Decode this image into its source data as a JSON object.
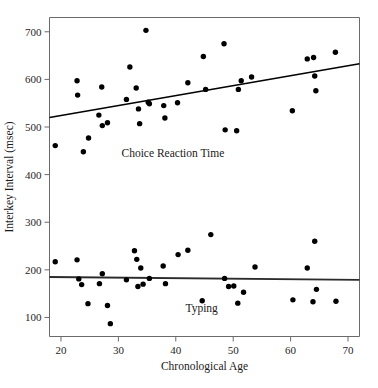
{
  "chart_data": {
    "type": "scatter",
    "title": "",
    "xlabel": "Chronological Age",
    "ylabel": "Interkey Interval (msec)",
    "xlim": [
      18,
      72
    ],
    "ylim": [
      60,
      730
    ],
    "xticks": [
      20,
      30,
      40,
      50,
      60,
      70
    ],
    "yticks": [
      100,
      200,
      300,
      400,
      500,
      600,
      700
    ],
    "grid": false,
    "legend_position": "in-plot annotations",
    "series": [
      {
        "name": "Choice Reaction Time",
        "label_x": 39.5,
        "label_y": 437,
        "points": [
          [
            19.0,
            461
          ],
          [
            22.8,
            597
          ],
          [
            22.9,
            567
          ],
          [
            23.9,
            448
          ],
          [
            24.8,
            477
          ],
          [
            26.6,
            525
          ],
          [
            27.1,
            584
          ],
          [
            27.2,
            503
          ],
          [
            28.1,
            509
          ],
          [
            31.4,
            558
          ],
          [
            32.0,
            626
          ],
          [
            33.1,
            582
          ],
          [
            33.5,
            538
          ],
          [
            33.7,
            507
          ],
          [
            34.8,
            703
          ],
          [
            35.2,
            552
          ],
          [
            35.4,
            549
          ],
          [
            37.9,
            545
          ],
          [
            38.1,
            519
          ],
          [
            40.3,
            551
          ],
          [
            42.1,
            593
          ],
          [
            44.8,
            648
          ],
          [
            45.2,
            579
          ],
          [
            48.4,
            675
          ],
          [
            48.6,
            494
          ],
          [
            50.6,
            492
          ],
          [
            50.9,
            579
          ],
          [
            51.4,
            597
          ],
          [
            53.2,
            605
          ],
          [
            60.3,
            534
          ],
          [
            62.9,
            643
          ],
          [
            64.0,
            646
          ],
          [
            64.2,
            607
          ],
          [
            64.4,
            576
          ],
          [
            67.8,
            657
          ]
        ],
        "fit_line": {
          "x0": 18,
          "y0": 520,
          "x1": 72,
          "y1": 633
        }
      },
      {
        "name": "Typing",
        "label_x": 44.5,
        "label_y": 112,
        "points": [
          [
            19.0,
            217
          ],
          [
            22.8,
            221
          ],
          [
            23.1,
            181
          ],
          [
            23.6,
            169
          ],
          [
            24.7,
            129
          ],
          [
            26.7,
            171
          ],
          [
            27.2,
            192
          ],
          [
            28.1,
            125
          ],
          [
            28.6,
            87
          ],
          [
            31.4,
            179
          ],
          [
            32.8,
            240
          ],
          [
            33.2,
            222
          ],
          [
            33.4,
            165
          ],
          [
            33.9,
            204
          ],
          [
            34.3,
            170
          ],
          [
            35.4,
            182
          ],
          [
            37.8,
            208
          ],
          [
            38.2,
            171
          ],
          [
            40.4,
            232
          ],
          [
            42.1,
            241
          ],
          [
            44.6,
            135
          ],
          [
            46.1,
            274
          ],
          [
            48.5,
            182
          ],
          [
            49.2,
            165
          ],
          [
            50.1,
            166
          ],
          [
            50.8,
            130
          ],
          [
            51.8,
            153
          ],
          [
            53.8,
            206
          ],
          [
            60.4,
            137
          ],
          [
            62.9,
            204
          ],
          [
            63.9,
            133
          ],
          [
            64.2,
            260
          ],
          [
            64.5,
            159
          ],
          [
            67.9,
            134
          ]
        ],
        "fit_line": {
          "x0": 18,
          "y0": 185,
          "x1": 72,
          "y1": 179
        }
      }
    ]
  },
  "axes": {
    "x_tick_labels": [
      "20",
      "30",
      "40",
      "50",
      "60",
      "70"
    ],
    "y_tick_labels": [
      "100",
      "200",
      "300",
      "400",
      "500",
      "600",
      "700"
    ],
    "x_title": "Chronological Age",
    "y_title": "Interkey Interval (msec)"
  },
  "annotations": {
    "choice_reaction_time": "Choice Reaction Time",
    "typing": "Typing"
  }
}
